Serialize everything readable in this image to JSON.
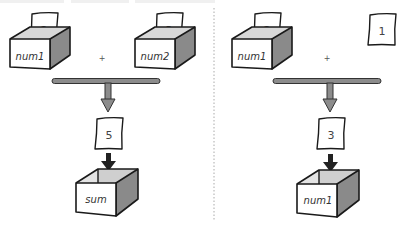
{
  "diagram": {
    "type": "variable-assignment-illustration",
    "colors": {
      "outline": "#1a1a1a",
      "box_front": "#ffffff",
      "box_inner": "#d6d6d6",
      "box_side": "#8a8a8a",
      "bar_fill": "#8c8c8c",
      "arrow_black": "#222222",
      "divider": "#aaaaaa"
    },
    "left_panel": {
      "inputs": [
        {
          "box_label": "num1",
          "paper_value": "2"
        },
        {
          "box_label": "num2",
          "paper_value": "3"
        }
      ],
      "operator": "+",
      "result_paper": "5",
      "target_box_label": "sum"
    },
    "right_panel": {
      "inputs": [
        {
          "box_label": "num1",
          "paper_value": "2"
        },
        {
          "paper_value": "1"
        }
      ],
      "operator": "+",
      "result_paper": "3",
      "target_box_label": "num1"
    }
  }
}
